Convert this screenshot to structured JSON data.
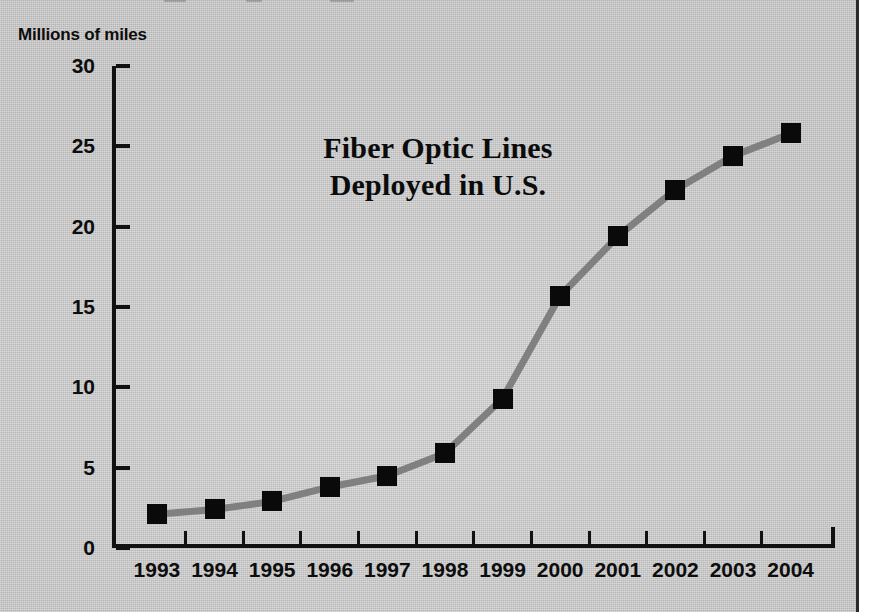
{
  "figure": {
    "background_color": "#cbcbcb",
    "border_color": "#2a2a2a",
    "axis_color": "#111111",
    "line_color": "#808080",
    "marker_color": "#0a0a0a"
  },
  "title": {
    "line1": "Fiber Optic Lines",
    "line2": "Deployed in U.S."
  },
  "axis": {
    "y_unit_label": "Millions of miles"
  },
  "chart_data": {
    "type": "line",
    "title": "Fiber Optic Lines Deployed in U.S.",
    "subtitle": "",
    "xlabel": "",
    "ylabel": "Millions of miles",
    "categories": [
      "1993",
      "1994",
      "1995",
      "1996",
      "1997",
      "1998",
      "1999",
      "2000",
      "2001",
      "2002",
      "2003",
      "2004"
    ],
    "values": [
      2.1,
      2.4,
      2.9,
      3.8,
      4.5,
      5.9,
      9.3,
      15.7,
      19.4,
      22.3,
      24.4,
      25.8
    ],
    "series": [
      {
        "name": "Fiber optic lines deployed",
        "values": [
          2.1,
          2.4,
          2.9,
          3.8,
          4.5,
          5.9,
          9.3,
          15.7,
          19.4,
          22.3,
          24.4,
          25.8
        ]
      }
    ],
    "ylim": [
      0,
      30
    ],
    "yticks": [
      0,
      5,
      10,
      15,
      20,
      25,
      30
    ],
    "ytick_labels": [
      "0",
      "5",
      "10",
      "15",
      "20",
      "25",
      "30"
    ],
    "grid": false,
    "legend": false,
    "legend_position": "none",
    "marker": "square",
    "annotations": []
  }
}
